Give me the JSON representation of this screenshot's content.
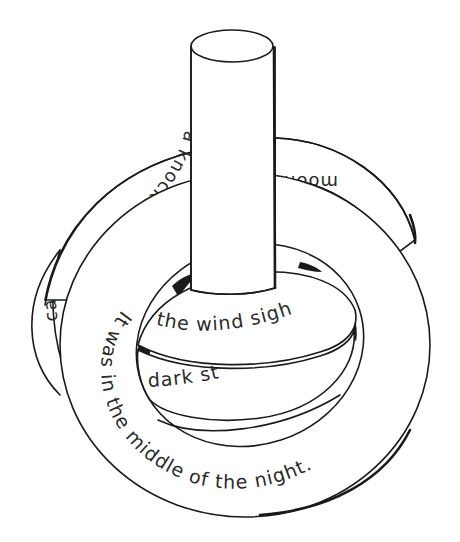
{
  "illustration": {
    "subject": "post with three stacked rings bearing text",
    "colors": {
      "line": "#1a1a1a",
      "text": "#2a2a2a",
      "background": "#ffffff"
    },
    "rings": [
      {
        "id": "back-ring",
        "text_left": "a knocke",
        "text_right": "moon w",
        "text_edge": "ca"
      },
      {
        "id": "front-ring",
        "text": "It was in the middle of the night."
      },
      {
        "id": "inner-ring-upper",
        "text": "the wind sigh"
      },
      {
        "id": "inner-ring-lower",
        "text": "dark st"
      }
    ]
  }
}
